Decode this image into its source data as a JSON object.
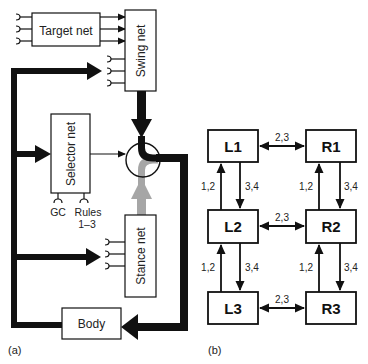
{
  "panel_a": {
    "label": "(a)",
    "boxes": {
      "target_net": "Target net",
      "swing_net": "Swing net",
      "selector_net": "Selector net",
      "stance_net": "Stance net",
      "body": "Body"
    },
    "inputs": {
      "gc": "GC",
      "rules_line1": "Rules",
      "rules_line2": "1–3"
    }
  },
  "panel_b": {
    "label": "(b)",
    "nodes": {
      "l1": "L1",
      "r1": "R1",
      "l2": "L2",
      "r2": "R2",
      "l3": "L3",
      "r3": "R3"
    },
    "edges": {
      "l1_r1": "2,3",
      "l2_r2": "2,3",
      "l3_r3": "2,3",
      "l2_l1": "1,2",
      "l1_l2": "3,4",
      "r2_r1": "1,2",
      "r1_r2": "3,4",
      "l3_l2": "1,2",
      "l2_l3": "3,4",
      "r3_r2": "1,2",
      "r2_r3": "3,4"
    }
  },
  "colors": {
    "ink": "#111111",
    "gray_path": "#a6a6a6"
  }
}
